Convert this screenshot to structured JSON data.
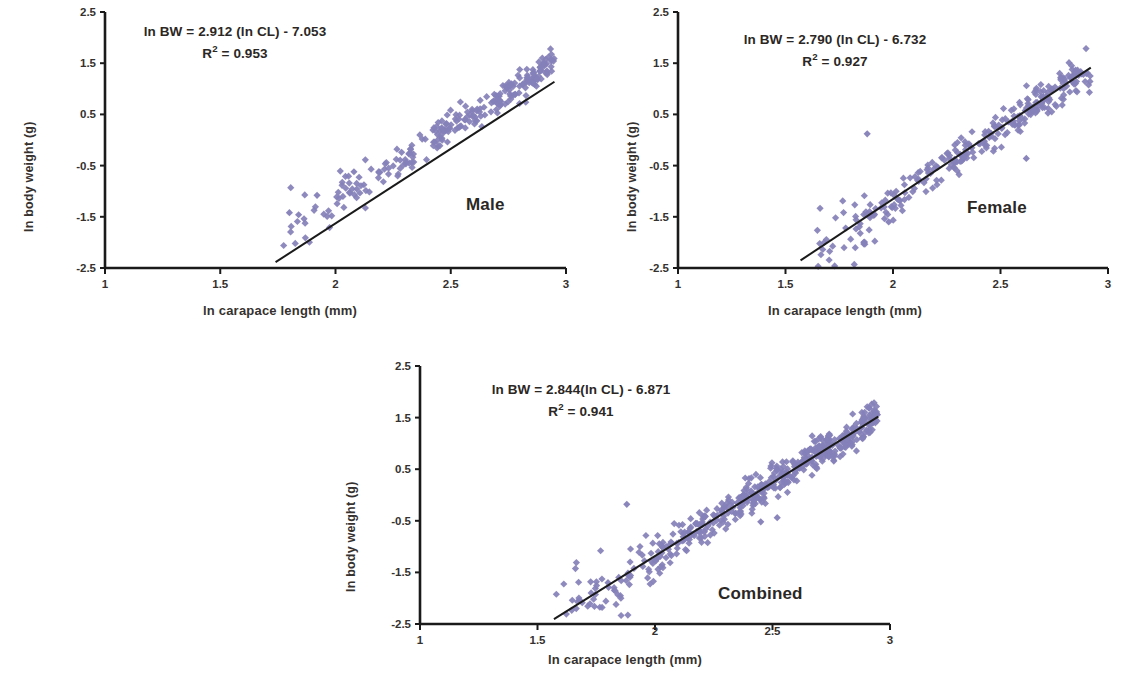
{
  "figure": {
    "type": "multi-panel-scatter",
    "panel_count": 3,
    "marker_color": "#8480b8",
    "line_color": "#1a1a1a",
    "axis_color": "#1a1a1a",
    "background": "#ffffff"
  },
  "axes": {
    "x_title": "ln carapace length (mm)",
    "y_title": "ln body weight (g)",
    "x_ticks": [
      "1",
      "1.5",
      "2",
      "2.5",
      "3"
    ],
    "y_ticks": [
      "2.5",
      "1.5",
      "0.5",
      "-0.5",
      "-1.5",
      "-2.5"
    ],
    "xlim": [
      1,
      3
    ],
    "ylim": [
      -2.5,
      2.5
    ]
  },
  "panels": [
    {
      "id": "male",
      "label": "Male",
      "equation_line1": "ln BW = 2.912 (ln CL) - 7.053",
      "equation_r2_prefix": "R",
      "equation_r2_sup": "2",
      "equation_r2_value": " = 0.953",
      "slope": 2.912,
      "intercept": -7.053,
      "r2": 0.953
    },
    {
      "id": "female",
      "label": "Female",
      "equation_line1": "ln BW = 2.790 (ln CL) - 6.732",
      "equation_r2_prefix": "R",
      "equation_r2_sup": "2",
      "equation_r2_value": " = 0.927",
      "slope": 2.79,
      "intercept": -6.732,
      "r2": 0.927
    },
    {
      "id": "combined",
      "label": "Combined",
      "equation_line1": "ln BW = 2.844(ln CL) - 6.871",
      "equation_r2_prefix": "R",
      "equation_r2_sup": "2",
      "equation_r2_value": " = 0.941",
      "slope": 2.844,
      "intercept": -6.871,
      "r2": 0.941
    }
  ],
  "chart_data": {
    "type": "scatter",
    "title": "",
    "xlabel": "ln carapace length (mm)",
    "ylabel": "ln body weight (g)",
    "xlim": [
      1,
      3
    ],
    "ylim": [
      -2.5,
      2.5
    ],
    "xticks": [
      1,
      1.5,
      2,
      2.5,
      3
    ],
    "yticks": [
      -2.5,
      -1.5,
      -0.5,
      0.5,
      1.5,
      2.5
    ],
    "grid": false,
    "legend": "none",
    "panels": [
      {
        "name": "Male",
        "n_points": 260,
        "x_range": [
          1.74,
          2.95
        ],
        "y_range": [
          -1.95,
          1.55
        ],
        "fit": {
          "slope": 2.912,
          "intercept": -7.053,
          "r2": 0.953
        },
        "fit_line_endpoints": [
          [
            1.74,
            -2.386
          ],
          [
            2.95,
            1.138
          ]
        ],
        "residual_sd": 0.14,
        "outliers": [
          [
            1.8,
            -1.42
          ],
          [
            1.84,
            -1.46
          ],
          [
            1.92,
            -1.08
          ],
          [
            2.08,
            -0.62
          ]
        ]
      },
      {
        "name": "Female",
        "n_points": 300,
        "x_range": [
          1.57,
          2.92
        ],
        "y_range": [
          -2.35,
          1.42
        ],
        "fit": {
          "slope": 2.79,
          "intercept": -6.732,
          "r2": 0.927
        },
        "fit_line_endpoints": [
          [
            1.57,
            -2.352
          ],
          [
            2.92,
            1.415
          ]
        ],
        "residual_sd": 0.17,
        "outliers": [
          [
            1.88,
            0.12
          ],
          [
            2.62,
            -0.36
          ],
          [
            1.78,
            -1.72
          ],
          [
            1.98,
            -1.6
          ]
        ]
      },
      {
        "name": "Combined",
        "n_points": 520,
        "x_range": [
          1.57,
          2.95
        ],
        "y_range": [
          -2.4,
          1.52
        ],
        "fit": {
          "slope": 2.844,
          "intercept": -6.871,
          "r2": 0.941
        },
        "fit_line_endpoints": [
          [
            1.57,
            -2.406
          ],
          [
            2.95,
            1.519
          ]
        ],
        "residual_sd": 0.16,
        "outliers": [
          [
            1.88,
            -0.18
          ],
          [
            2.45,
            -0.52
          ],
          [
            2.52,
            -0.44
          ],
          [
            1.8,
            -1.7
          ]
        ]
      }
    ]
  }
}
